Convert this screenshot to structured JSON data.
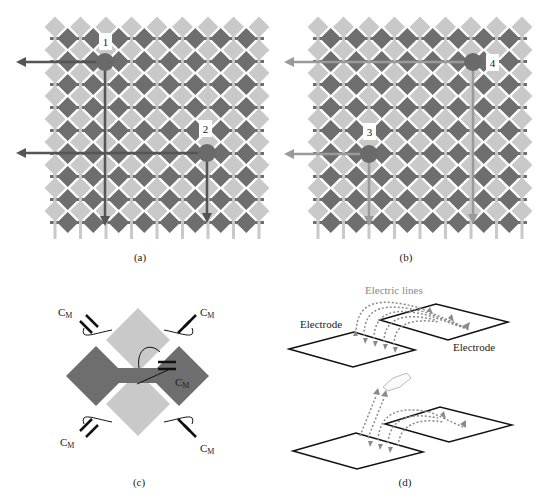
{
  "figure": {
    "panels": [
      {
        "id": "a",
        "caption": "(a)",
        "points": [
          {
            "label": "1"
          },
          {
            "label": "2"
          }
        ]
      },
      {
        "id": "b",
        "caption": "(b)",
        "points": [
          {
            "label": "3"
          },
          {
            "label": "4"
          }
        ]
      },
      {
        "id": "c",
        "caption": "(c)",
        "capacitor_label": "C",
        "capacitor_subscript": "M"
      },
      {
        "id": "d",
        "caption": "(d)",
        "labels": {
          "electric_lines": "Electric lines",
          "electrode_left": "Electrode",
          "electrode_right": "Electrode"
        }
      }
    ],
    "colors": {
      "light_diamond": "#c9c9c9",
      "dark_diamond": "#6e6e6e",
      "arrow_a": "#555555",
      "arrow_b": "#9a9a9a",
      "touch_point": "#6a6a6a",
      "electric_line": "#8a8a8a"
    }
  }
}
